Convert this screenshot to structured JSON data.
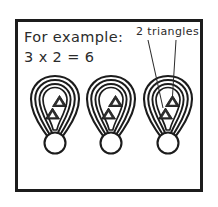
{
  "figure": {
    "background_color": "#ffffff",
    "frame": {
      "stroke_color": "#1c1c1c",
      "stroke_width": 3
    },
    "ink_color": "#2b2b2b"
  },
  "annotations": {
    "example_heading": "For example:",
    "equation": "3 x 2 = 6",
    "callout_label": "2 triangles",
    "leader_lines": 2
  },
  "diagram_data": {
    "type": "grouped-objects",
    "group_count": 3,
    "items_per_group": 2,
    "total_items": 6,
    "item_shape": "triangle",
    "container_shape": "balloon",
    "container_outline_rings": 3,
    "containers": [
      {
        "index": 1,
        "label": "balloon-1",
        "triangle_count": 2,
        "center_x": 55,
        "has_callout": false
      },
      {
        "index": 2,
        "label": "balloon-2",
        "triangle_count": 2,
        "center_x": 110,
        "has_callout": false
      },
      {
        "index": 3,
        "label": "balloon-3",
        "triangle_count": 2,
        "center_x": 168,
        "has_callout": true
      }
    ]
  }
}
